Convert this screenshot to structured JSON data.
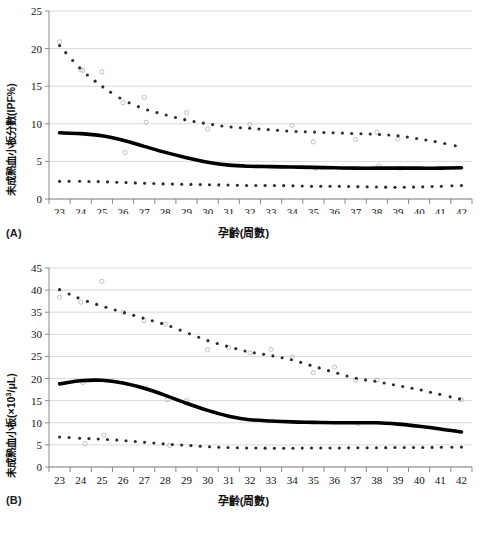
{
  "figure": {
    "panels": [
      {
        "id": "A",
        "panel_label": "(A)",
        "xlabel": "孕齡(周數)",
        "ylabel": "未成熟血小板分數(IPF%)"
      },
      {
        "id": "B",
        "panel_label": "(B)",
        "xlabel": "孕齡(周數)",
        "ylabel_pre": "未成熟血小板(×10",
        "ylabel_sup": "3",
        "ylabel_post": "/μL)"
      }
    ]
  },
  "chart_data": [
    {
      "type": "line",
      "id": "A",
      "title": "",
      "xlabel": "孕齡(周數)",
      "ylabel": "未成熟血小板分數(IPF%)",
      "xlim": [
        22.5,
        42.5
      ],
      "ylim": [
        0,
        25
      ],
      "xticks": [
        23,
        24,
        25,
        26,
        27,
        28,
        29,
        30,
        31,
        32,
        33,
        34,
        35,
        36,
        37,
        38,
        39,
        40,
        41,
        42
      ],
      "yticks": [
        0,
        5,
        10,
        15,
        20,
        25
      ],
      "grid": "horizontal",
      "legend": "none",
      "x": [
        23,
        24,
        25,
        26,
        27,
        28,
        29,
        30,
        31,
        32,
        33,
        34,
        35,
        36,
        37,
        38,
        39,
        40,
        41,
        42
      ],
      "series": [
        {
          "name": "97th percentile (dotted upper)",
          "style": "dotted",
          "values": [
            20.4,
            17.3,
            15.0,
            13.2,
            12.0,
            11.2,
            10.5,
            10.0,
            9.6,
            9.4,
            9.2,
            9.0,
            8.9,
            8.8,
            8.7,
            8.6,
            8.4,
            8.0,
            7.5,
            6.9
          ]
        },
        {
          "name": "Median (solid bold)",
          "style": "solid",
          "values": [
            8.8,
            8.7,
            8.4,
            7.8,
            7.0,
            6.2,
            5.5,
            4.9,
            4.5,
            4.35,
            4.3,
            4.25,
            4.2,
            4.15,
            4.1,
            4.1,
            4.1,
            4.1,
            4.1,
            4.15
          ]
        },
        {
          "name": "3rd percentile (dotted lower)",
          "style": "dotted",
          "values": [
            2.35,
            2.35,
            2.3,
            2.2,
            2.1,
            2.0,
            1.95,
            1.9,
            1.85,
            1.8,
            1.8,
            1.75,
            1.7,
            1.7,
            1.65,
            1.6,
            1.55,
            1.6,
            1.7,
            1.8
          ]
        }
      ],
      "scatter": [
        {
          "x": 23.0,
          "y": 20.9
        },
        {
          "x": 24.0,
          "y": 17.2
        },
        {
          "x": 24.1,
          "y": 17.1
        },
        {
          "x": 25.0,
          "y": 16.9
        },
        {
          "x": 26.0,
          "y": 12.8
        },
        {
          "x": 26.1,
          "y": 6.2
        },
        {
          "x": 27.0,
          "y": 13.5
        },
        {
          "x": 27.1,
          "y": 10.2
        },
        {
          "x": 29.0,
          "y": 11.5
        },
        {
          "x": 30.0,
          "y": 9.3
        },
        {
          "x": 32.0,
          "y": 9.9
        },
        {
          "x": 34.0,
          "y": 9.8
        },
        {
          "x": 35.0,
          "y": 7.6
        },
        {
          "x": 35.1,
          "y": 4.1
        },
        {
          "x": 37.0,
          "y": 7.9
        },
        {
          "x": 38.0,
          "y": 8.9
        },
        {
          "x": 38.1,
          "y": 4.4
        },
        {
          "x": 39.0,
          "y": 8.0
        },
        {
          "x": 39.1,
          "y": 4.1
        }
      ]
    },
    {
      "type": "line",
      "id": "B",
      "title": "",
      "xlabel": "孕齡(周數)",
      "ylabel": "未成熟血小板(×10³/μL)",
      "xlim": [
        22.5,
        42.5
      ],
      "ylim": [
        0,
        45
      ],
      "xticks": [
        23,
        24,
        25,
        26,
        27,
        28,
        29,
        30,
        31,
        32,
        33,
        34,
        35,
        36,
        37,
        38,
        39,
        40,
        41,
        42
      ],
      "yticks": [
        0,
        5,
        10,
        15,
        20,
        25,
        30,
        35,
        40,
        45
      ],
      "grid": "horizontal",
      "legend": "none",
      "x": [
        23,
        24,
        25,
        26,
        27,
        28,
        29,
        30,
        31,
        32,
        33,
        34,
        35,
        36,
        37,
        38,
        39,
        40,
        41,
        42
      ],
      "series": [
        {
          "name": "97th percentile (dotted upper)",
          "style": "dotted",
          "values": [
            40.1,
            38.0,
            36.4,
            35.0,
            33.6,
            32.2,
            30.4,
            28.6,
            27.2,
            26.0,
            25.2,
            24.2,
            22.8,
            21.4,
            20.1,
            19.3,
            18.4,
            17.5,
            16.4,
            15.3
          ]
        },
        {
          "name": "Median (solid bold)",
          "style": "solid",
          "values": [
            18.8,
            19.5,
            19.6,
            19.0,
            17.8,
            16.2,
            14.4,
            12.8,
            11.5,
            10.7,
            10.4,
            10.2,
            10.1,
            10.0,
            10.0,
            10.0,
            9.7,
            9.2,
            8.6,
            7.9
          ]
        },
        {
          "name": "3rd percentile (dotted lower)",
          "style": "dotted",
          "values": [
            6.8,
            6.5,
            6.3,
            6.0,
            5.6,
            5.2,
            4.9,
            4.6,
            4.4,
            4.3,
            4.25,
            4.25,
            4.3,
            4.3,
            4.35,
            4.35,
            4.4,
            4.4,
            4.45,
            4.5
          ]
        }
      ],
      "scatter": [
        {
          "x": 23.0,
          "y": 38.4
        },
        {
          "x": 24.0,
          "y": 37.3
        },
        {
          "x": 25.0,
          "y": 42.0
        },
        {
          "x": 25.1,
          "y": 7.2
        },
        {
          "x": 24.1,
          "y": 19.1
        },
        {
          "x": 24.2,
          "y": 5.3
        },
        {
          "x": 26.0,
          "y": 35.0
        },
        {
          "x": 27.0,
          "y": 33.1
        },
        {
          "x": 27.1,
          "y": 17.8
        },
        {
          "x": 28.0,
          "y": 32.3
        },
        {
          "x": 28.1,
          "y": 15.2
        },
        {
          "x": 28.2,
          "y": 4.9
        },
        {
          "x": 29.0,
          "y": 15.0
        },
        {
          "x": 30.0,
          "y": 26.5
        },
        {
          "x": 31.0,
          "y": 27.0
        },
        {
          "x": 32.0,
          "y": 25.8
        },
        {
          "x": 33.0,
          "y": 26.6
        },
        {
          "x": 34.0,
          "y": 24.9
        },
        {
          "x": 35.0,
          "y": 21.3
        },
        {
          "x": 36.0,
          "y": 22.6
        },
        {
          "x": 37.0,
          "y": 19.7
        },
        {
          "x": 37.1,
          "y": 9.8
        },
        {
          "x": 38.0,
          "y": 19.7
        },
        {
          "x": 42.0,
          "y": 15.2
        }
      ]
    }
  ]
}
